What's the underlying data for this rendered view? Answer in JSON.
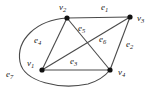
{
  "figure": {
    "kind": "undirected-graph-diagram",
    "background_color": "#ffffff",
    "stroke_color": "#4a4a4a",
    "vertex_color": "#111111",
    "label_color": "#1a1a1a"
  },
  "vertices": [
    {
      "id": "v1",
      "name": "v",
      "index": "1",
      "x": 42,
      "y": 70,
      "label_x": 27,
      "label_y": 59
    },
    {
      "id": "v2",
      "name": "v",
      "index": "2",
      "x": 67,
      "y": 18,
      "label_x": 59,
      "label_y": 3
    },
    {
      "id": "v3",
      "name": "v",
      "index": "3",
      "x": 130,
      "y": 17,
      "label_x": 137,
      "label_y": 14
    },
    {
      "id": "v4",
      "name": "v",
      "index": "4",
      "x": 110,
      "y": 70,
      "label_x": 118,
      "label_y": 68
    }
  ],
  "edges": [
    {
      "id": "e1",
      "name": "e",
      "index": "1",
      "from": "v2",
      "to": "v3",
      "shape": "straight",
      "label_x": 101,
      "label_y": 3
    },
    {
      "id": "e2",
      "name": "e",
      "index": "2",
      "from": "v3",
      "to": "v4",
      "shape": "straight",
      "label_x": 126,
      "label_y": 40
    },
    {
      "id": "e3",
      "name": "e",
      "index": "3",
      "from": "v1",
      "to": "v4",
      "shape": "straight",
      "label_x": 70,
      "label_y": 57
    },
    {
      "id": "e4",
      "name": "e",
      "index": "4",
      "from": "v1",
      "to": "v2",
      "shape": "straight",
      "label_x": 34,
      "label_y": 36
    },
    {
      "id": "e5",
      "name": "e",
      "index": "5",
      "from": "v2",
      "to": "v4",
      "shape": "straight",
      "label_x": 78,
      "label_y": 24
    },
    {
      "id": "e6",
      "name": "e",
      "index": "6",
      "from": "v1",
      "to": "v3",
      "shape": "straight",
      "label_x": 99,
      "label_y": 35
    },
    {
      "id": "e7",
      "name": "e",
      "index": "7",
      "from": "v2",
      "to": "v4",
      "shape": "curved-left-sweep",
      "label_x": 6,
      "label_y": 70
    }
  ]
}
